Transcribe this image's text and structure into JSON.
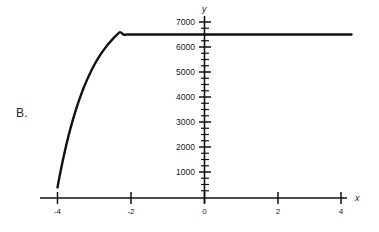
{
  "figure": {
    "panel_label": "B.",
    "background_color": "#ffffff",
    "ink_color": "#111111"
  },
  "chart_data": {
    "type": "line",
    "title": "",
    "subtitle": "",
    "xlabel": "x",
    "ylabel": "y",
    "xlim": [
      -4.6,
      4.6
    ],
    "ylim": [
      0,
      7400
    ],
    "grid": false,
    "legend": null,
    "x_ticks": [
      -4,
      -2,
      0,
      2,
      4
    ],
    "x_tick_labels": [
      "-4",
      "-2",
      "0",
      "2",
      "4"
    ],
    "y_ticks": [
      1000,
      2000,
      3000,
      4000,
      5000,
      6000,
      7000
    ],
    "y_tick_labels": [
      "1000",
      "2000",
      "3000",
      "4000",
      "5000",
      "6000",
      "7000"
    ],
    "y_minor_tick_step": 250,
    "asymptote": 6500,
    "series": [
      {
        "name": "exponential-saturation-curve",
        "color": "#111111",
        "x": [
          -4.0,
          -3.9,
          -3.8,
          -3.7,
          -3.6,
          -3.5,
          -3.4,
          -3.3,
          -3.2,
          -3.1,
          -3.0,
          -2.9,
          -2.8,
          -2.7,
          -2.6,
          -2.5,
          -2.4,
          -2.3,
          -2.2,
          -2.1,
          -2.0,
          -1.9,
          -1.8,
          -1.7,
          -1.6,
          -1.5,
          -1.4,
          -1.3,
          -1.2,
          -1.1,
          -1.0,
          -0.8,
          -0.6,
          -0.4,
          -0.2,
          0.0,
          0.5,
          1.0,
          1.5,
          2.0,
          2.5,
          3.0,
          3.5,
          4.0
        ],
        "y": [
          420,
          1180,
          1860,
          2470,
          3015,
          3505,
          3943,
          4337,
          4689,
          5005,
          5288,
          5541,
          5769,
          5972,
          6155,
          6318,
          6465,
          6596,
          6500,
          6500,
          6500,
          6500,
          6500,
          6500,
          6500,
          6500,
          6500,
          6500,
          6500,
          6500,
          6500,
          6500,
          6500,
          6500,
          6500,
          6500,
          6500,
          6500,
          6500,
          6500,
          6500,
          6500,
          6500,
          6500
        ]
      }
    ],
    "annotations": [
      {
        "text": "B.",
        "role": "panel-label"
      }
    ]
  },
  "axes": {
    "y_axis_name": "y",
    "x_axis_name": "x"
  }
}
